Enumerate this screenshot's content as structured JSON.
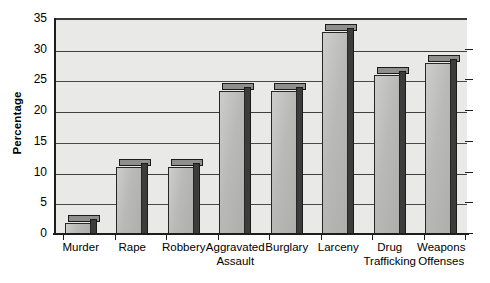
{
  "chart_data": {
    "type": "bar",
    "title": "",
    "xlabel": "",
    "ylabel": "Percentage",
    "ylim": [
      0,
      35
    ],
    "ytick_step": 5,
    "yticks": [
      0,
      5,
      10,
      15,
      20,
      25,
      30,
      35
    ],
    "ytick_labels": [
      "0",
      "5",
      "10",
      "15",
      "20",
      "25",
      "30",
      "35"
    ],
    "grid": true,
    "legend": false,
    "categories": [
      "Murder",
      "Rape",
      "Robbery",
      "Aggravated Assault",
      "Burglary",
      "Larceny",
      "Drug Trafficking",
      "Weapons Offenses"
    ],
    "category_lines": [
      [
        "Murder"
      ],
      [
        "Rape"
      ],
      [
        "Robbery"
      ],
      [
        "Aggravated",
        "Assault"
      ],
      [
        "Burglary"
      ],
      [
        "Larceny"
      ],
      [
        "Drug",
        "Trafficking"
      ],
      [
        "Weapons",
        "Offenses"
      ]
    ],
    "values": [
      2,
      11,
      11,
      23.5,
      23.5,
      33,
      26,
      28
    ],
    "colors": {
      "plot_background": "#e9e9e7",
      "bar_face": "#b9b9b7",
      "bar_side": "#3c3c3c",
      "bar_top": "#8f8f8d",
      "gridline": "#3f3f3f",
      "axis": "#1d1d1d",
      "text": "#000000"
    }
  }
}
